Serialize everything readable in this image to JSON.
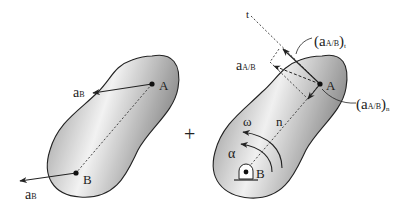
{
  "figure": {
    "left_body": {
      "point_a": "A",
      "point_b": "B",
      "accel_a_label": "a",
      "accel_a_sub": "B",
      "accel_b_label": "a",
      "accel_b_sub": "B"
    },
    "operator": "+",
    "right_body": {
      "point_a": "A",
      "point_b": "B",
      "t_axis": "t",
      "n_axis": "n",
      "omega": "ω",
      "alpha": "α",
      "rel_accel_label": "a",
      "rel_accel_sub": "A/B",
      "tangential_open": "(a",
      "tangential_sub": "A/B",
      "tangential_close": ")",
      "tangential_index": "t",
      "normal_open": "(a",
      "normal_sub": "A/B",
      "normal_close": ")",
      "normal_index": "n"
    }
  },
  "colors": {
    "body_dark": "#8a8a8a",
    "body_light": "#f4f4f4",
    "line": "#222222"
  }
}
